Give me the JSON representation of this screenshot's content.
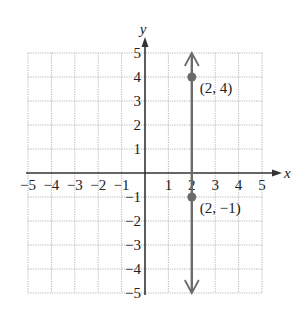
{
  "chart_data": {
    "type": "line",
    "title": "",
    "xlabel": "x",
    "ylabel": "y",
    "xlim": [
      -5,
      5
    ],
    "ylim": [
      -5,
      5
    ],
    "grid": true,
    "x_ticks": [
      -5,
      -4,
      -3,
      -2,
      -1,
      1,
      2,
      3,
      4,
      5
    ],
    "y_ticks": [
      -5,
      -4,
      -3,
      -2,
      -1,
      1,
      2,
      3,
      4,
      5
    ],
    "x_tick_labels": [
      "−5",
      "−4",
      "−3",
      "−2",
      "−1",
      "1",
      "2",
      "3",
      "4",
      "5"
    ],
    "y_tick_labels": [
      "−5",
      "−4",
      "−3",
      "−2",
      "−1",
      "1",
      "2",
      "3",
      "4",
      "5"
    ],
    "series": [
      {
        "name": "x = 2",
        "kind": "vertical-line",
        "x": 2,
        "y_range": [
          -5,
          5
        ],
        "arrows": "both",
        "color": "#6b6b6b"
      }
    ],
    "points": [
      {
        "x": 2,
        "y": 4,
        "label": "(2, 4)"
      },
      {
        "x": 2,
        "y": -1,
        "label": "(2, −1)"
      }
    ],
    "colors": {
      "axis": "#333333",
      "grid": "#b5b5b5",
      "line": "#6b6b6b",
      "point": "#6b6b6b"
    }
  }
}
